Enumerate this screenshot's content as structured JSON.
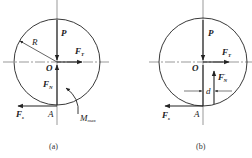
{
  "figures": [
    {
      "id": "a",
      "caption": "(a)",
      "labels": {
        "P": "P",
        "FT": "F",
        "FT_sub": "T",
        "O": "O",
        "R": "R",
        "FN": "F",
        "FN_sub": "N",
        "Fs": "F",
        "Fs_sub": "s",
        "A": "A",
        "M": "M",
        "M_sub": "max"
      }
    },
    {
      "id": "b",
      "caption": "(b)",
      "labels": {
        "P": "P",
        "FT": "F",
        "FT_sub": "T",
        "O": "O",
        "FN": "F",
        "FN_sub": "N",
        "FN_prime": "′",
        "d": "d",
        "Fs": "F",
        "Fs_sub": "s",
        "A": "A"
      }
    }
  ],
  "colors": {
    "line": "#222222",
    "axis": "#555555"
  }
}
